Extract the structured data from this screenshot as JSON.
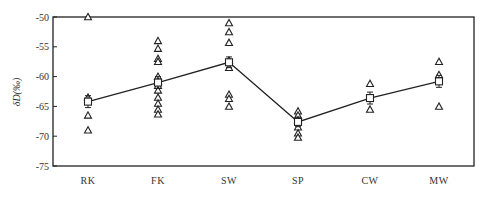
{
  "chart_data": {
    "type": "scatter",
    "title": "",
    "xlabel": "",
    "ylabel": "δD(‰)",
    "ylim": [
      -75,
      -50
    ],
    "yticks": [
      -50,
      -55,
      -60,
      -65,
      -70,
      -75
    ],
    "grid": false,
    "legend": null,
    "categories": [
      "RK",
      "FK",
      "SW",
      "SP",
      "CW",
      "MW"
    ],
    "series": [
      {
        "name": "individual samples",
        "marker": "open-triangle",
        "points": {
          "RK": [
            -50,
            -63.5,
            -66.5,
            -69
          ],
          "FK": [
            -54,
            -55.3,
            -57,
            -57.5,
            -60,
            -60.8,
            -61.5,
            -62.3,
            -63.5,
            -64.5,
            -65.5,
            -66.3
          ],
          "SW": [
            -51,
            -52.5,
            -54.3,
            -57.3,
            -58.5,
            -63,
            -63.7,
            -65
          ],
          "SP": [
            -65.8,
            -66.5,
            -67.3,
            -68.5,
            -69.5,
            -70.2
          ],
          "CW": [
            -61.2,
            -65.5
          ],
          "MW": [
            -57.5,
            -59.7,
            -65
          ]
        }
      },
      {
        "name": "mean ± error",
        "marker": "open-square",
        "line": true,
        "values": [
          -64.2,
          -61,
          -57.6,
          -67.6,
          -63.6,
          -60.8
        ],
        "errors": [
          1.0,
          1.0,
          0.9,
          0.8,
          1.0,
          1.0
        ]
      }
    ]
  }
}
